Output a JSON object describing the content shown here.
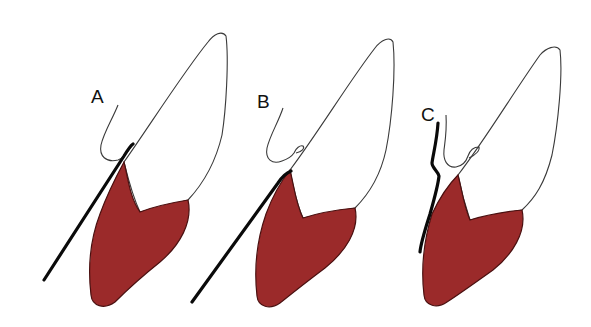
{
  "figure": {
    "colors": {
      "bone": "#9b2a2a",
      "bone_outline": "#4a1010",
      "outline": "#3a3a3a",
      "instrument": "#0a0a0a",
      "background": "#ffffff"
    },
    "panels": [
      {
        "label": "A",
        "instrument": "straight probe, placed alongside tooth at gingival margin"
      },
      {
        "label": "B",
        "instrument": "straight probe, placed inside gingival sulcus against bone crest"
      },
      {
        "label": "C",
        "instrument": "curved instrument, placed outside the gingiva"
      }
    ]
  }
}
